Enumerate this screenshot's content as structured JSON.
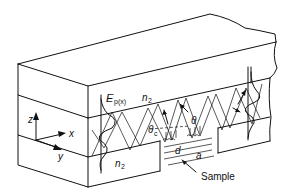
{
  "diagram": {
    "type": "waveguide-schematic",
    "labels": {
      "field": "E",
      "field_sub": "p(x)",
      "n2_top": "n",
      "n2_top_sub": "2",
      "n2_bottom": "n",
      "n2_bottom_sub": "2",
      "theta_c": "θ",
      "theta_c_sub": "c",
      "theta": "θ",
      "d": "d",
      "a": "a",
      "sample": "Sample",
      "axis_z": "z",
      "axis_x": "x",
      "axis_y": "y"
    },
    "colors": {
      "line": "#111111",
      "background": "#ffffff"
    }
  }
}
